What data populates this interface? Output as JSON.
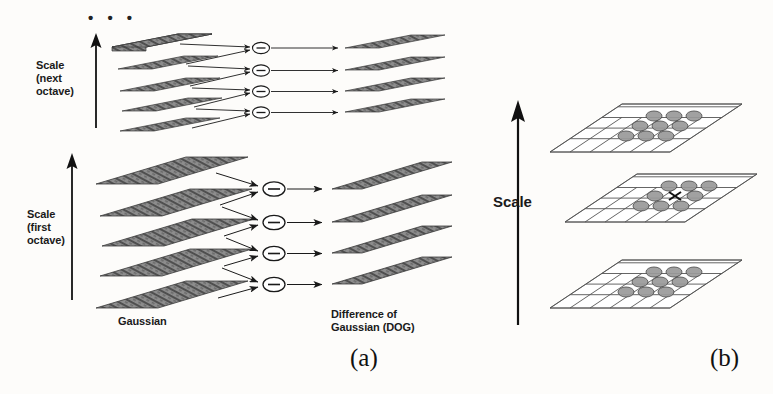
{
  "figure": {
    "ellipsis": "• • •",
    "captions": {
      "a": "(a)",
      "b": "(b)"
    }
  },
  "panel_a": {
    "labels": {
      "scale_next_octave": "Scale\n(next\noctave)",
      "scale_first_octave": "Scale\n(first\noctave)",
      "gaussian": "Gaussian",
      "dog": "Difference of\nGaussian (DOG)"
    },
    "operator_symbol": "−",
    "octaves": [
      {
        "name": "next-octave",
        "gaussian_planes": 5,
        "dog_planes": 4,
        "operators": 4
      },
      {
        "name": "first-octave",
        "gaussian_planes": 5,
        "dog_planes": 4,
        "operators": 4
      }
    ]
  },
  "panel_b": {
    "labels": {
      "scale": "Scale"
    },
    "planes": 3,
    "grid_cols": 6,
    "grid_rows": 5,
    "neighborhood": {
      "top_markers": 9,
      "middle_markers": 8,
      "bottom_markers": 9,
      "center_marker": "x-cross"
    }
  },
  "colors": {
    "background": "#fdfcfa",
    "ink": "#1a1a1a",
    "plane_fill": "#8d8d8d",
    "plane_edge": "#3a3a3a",
    "grid_line": "#555555",
    "marker_fill": "#9a9a9a",
    "marker_edge": "#4a4a4a"
  }
}
